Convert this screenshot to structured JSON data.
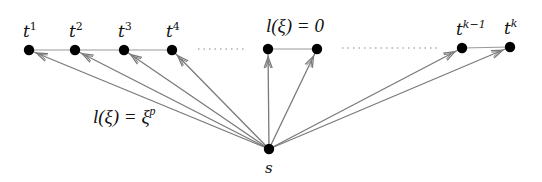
{
  "diagram": {
    "source": {
      "id": "s",
      "label": "s",
      "x": 269,
      "y": 149
    },
    "targets": [
      {
        "id": "t1",
        "base": "t",
        "sup": "1",
        "x": 29,
        "y": 50
      },
      {
        "id": "t2",
        "base": "t",
        "sup": "2",
        "x": 75,
        "y": 50
      },
      {
        "id": "t3",
        "base": "t",
        "sup": "3",
        "x": 124,
        "y": 50
      },
      {
        "id": "t4",
        "base": "t",
        "sup": "4",
        "x": 172,
        "y": 50
      },
      {
        "id": "m1",
        "base": "",
        "sup": "",
        "x": 268,
        "y": 49
      },
      {
        "id": "m2",
        "base": "",
        "sup": "",
        "x": 317,
        "y": 49
      },
      {
        "id": "tk-1",
        "base": "t",
        "sup": "k−1",
        "x": 462,
        "y": 48
      },
      {
        "id": "tk",
        "base": "t",
        "sup": "k",
        "x": 510,
        "y": 47
      }
    ],
    "path_edges": [
      [
        "t1",
        "t2"
      ],
      [
        "t2",
        "t3"
      ],
      [
        "t3",
        "t4"
      ],
      [
        "m1",
        "m2"
      ],
      [
        "tk-1",
        "tk"
      ]
    ],
    "dotted_segments": [
      {
        "x1": 198,
        "x2": 246,
        "y": 49
      },
      {
        "x1": 342,
        "x2": 438,
        "y": 48
      }
    ],
    "arrow_edges": [
      {
        "from": "s",
        "to": "t1",
        "count": 1
      },
      {
        "from": "s",
        "to": "t2",
        "count": 1
      },
      {
        "from": "s",
        "to": "t3",
        "count": 1
      },
      {
        "from": "s",
        "to": "t4",
        "count": 1
      },
      {
        "from": "s",
        "to": "m1",
        "count": 1
      },
      {
        "from": "s",
        "to": "m2",
        "count": 1
      },
      {
        "from": "s",
        "to": "tk-1",
        "count": 1
      },
      {
        "from": "s",
        "to": "tk",
        "count": 1
      }
    ],
    "annotations": [
      {
        "id": "zero-length",
        "text_prefix": "l(ξ) = 0",
        "sup": "",
        "x": 266,
        "y": 32
      },
      {
        "id": "power-length",
        "text_prefix": "l(ξ) = ξ",
        "sup": "p",
        "x": 93,
        "y": 123
      }
    ],
    "colors": {
      "node": "#000000",
      "edge": "#7a7a7a",
      "path_edge": "#9a9a9a",
      "dots": "#888888",
      "text": "#111111"
    }
  }
}
